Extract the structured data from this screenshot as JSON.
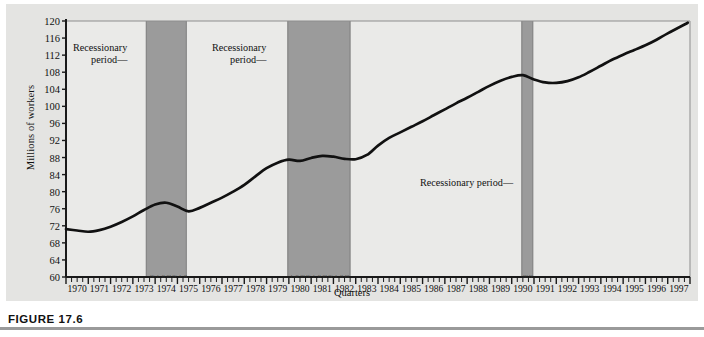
{
  "figure": {
    "caption": "FIGURE 17.6"
  },
  "chart_data": {
    "type": "line",
    "title": "",
    "xlabel": "Quarters",
    "ylabel": "Millions of workers",
    "ylim": [
      60,
      120
    ],
    "ytick_step": 4,
    "yticks": [
      120,
      116,
      112,
      108,
      104,
      100,
      96,
      92,
      88,
      84,
      80,
      76,
      72,
      68,
      64,
      60
    ],
    "xlim": [
      1970,
      1998
    ],
    "grid": false,
    "legend": "none",
    "xticks": [
      "1970",
      "1971",
      "1972",
      "1973",
      "1974",
      "1975",
      "1976",
      "1977",
      "1978",
      "1979",
      "1980",
      "1981",
      "1982",
      "1983",
      "1984",
      "1985",
      "1986",
      "1987",
      "1988",
      "1989",
      "1990",
      "1991",
      "1992",
      "1993",
      "1994",
      "1995",
      "1996",
      "1997"
    ],
    "quarter_marks": [
      "I",
      "II",
      "III",
      "IV"
    ],
    "series": [
      {
        "name": "Civilian employment",
        "x": [
          1970.0,
          1970.5,
          1971.0,
          1971.5,
          1972.0,
          1972.5,
          1973.0,
          1973.5,
          1974.0,
          1974.5,
          1975.0,
          1975.5,
          1976.0,
          1976.5,
          1977.0,
          1977.5,
          1978.0,
          1978.5,
          1979.0,
          1979.5,
          1980.0,
          1980.5,
          1981.0,
          1981.5,
          1982.0,
          1982.5,
          1983.0,
          1983.5,
          1984.0,
          1984.5,
          1985.0,
          1985.5,
          1986.0,
          1986.5,
          1987.0,
          1987.5,
          1988.0,
          1988.5,
          1989.0,
          1989.5,
          1990.0,
          1990.5,
          1991.0,
          1991.5,
          1992.0,
          1992.5,
          1993.0,
          1993.5,
          1994.0,
          1994.5,
          1995.0,
          1995.5,
          1996.0,
          1996.5,
          1997.0,
          1997.9
        ],
        "y": [
          71.2,
          70.9,
          70.6,
          71.0,
          71.8,
          72.9,
          74.2,
          75.7,
          77.0,
          77.4,
          76.5,
          75.4,
          76.2,
          77.4,
          78.6,
          80.0,
          81.6,
          83.6,
          85.5,
          86.8,
          87.5,
          87.2,
          87.9,
          88.4,
          88.2,
          87.7,
          87.6,
          88.6,
          90.8,
          92.6,
          93.9,
          95.2,
          96.5,
          97.9,
          99.3,
          100.7,
          102.0,
          103.4,
          104.8,
          106.0,
          106.9,
          107.3,
          106.3,
          105.6,
          105.5,
          105.9,
          106.8,
          108.1,
          109.5,
          110.9,
          112.1,
          113.2,
          114.3,
          115.6,
          117.1,
          119.6
        ]
      }
    ],
    "shaded_regions": [
      {
        "label": "Recessionary period",
        "start": 1973.6,
        "end": 1975.4
      },
      {
        "label": "Recessionary period",
        "start": 1979.95,
        "end": 1982.75
      },
      {
        "label": "Recessionary period",
        "start": 1990.45,
        "end": 1990.95
      }
    ],
    "annotations": [
      {
        "id": "annot-1",
        "lines": [
          "Recessionary",
          "period—"
        ],
        "x_px": 67,
        "y_px": 38
      },
      {
        "id": "annot-2",
        "lines": [
          "Recessionary",
          "period—"
        ],
        "x_px": 206,
        "y_px": 38
      },
      {
        "id": "annot-3",
        "lines": [
          "Recessionary period—"
        ],
        "x_px": 414,
        "y_px": 173
      }
    ],
    "colors": {
      "panel_background": "#e4e4e2",
      "plot_background": "#eaeae8",
      "shade": "#9b9b9b",
      "line": "#111111",
      "axis": "#1a1a1a",
      "text": "#111111"
    }
  }
}
